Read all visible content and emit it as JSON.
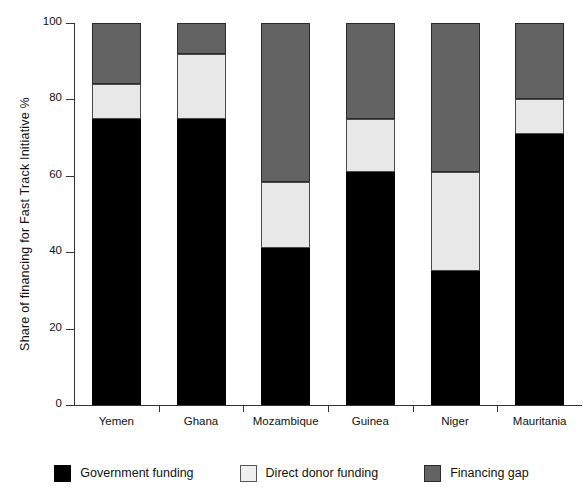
{
  "chart_data": {
    "type": "bar",
    "subtype": "stacked-bar-100-percent",
    "title": "",
    "xlabel": "",
    "ylabel": "Share of financing for Fast Track  Initiative %",
    "ylim": [
      0,
      100
    ],
    "yticks": [
      0,
      20,
      40,
      60,
      80,
      100
    ],
    "ytick_labels": [
      "0",
      "20",
      "40",
      "60",
      "80",
      "100"
    ],
    "grid": false,
    "legend_position": "bottom",
    "categories": [
      "Yemen",
      "Ghana",
      "Mozambique",
      "Guinea",
      "Niger",
      "Mauritania"
    ],
    "series": [
      {
        "name": "Government funding",
        "color": "#000000",
        "values": [
          75,
          75,
          41,
          61,
          35,
          71
        ]
      },
      {
        "name": "Direct donor funding",
        "color": "#e8e8e8",
        "values": [
          9,
          17,
          17.5,
          14,
          26,
          9
        ]
      },
      {
        "name": "Financing gap",
        "color": "#636363",
        "values": [
          16,
          8,
          41.5,
          25,
          39,
          20
        ]
      }
    ],
    "cumulative_tops": {
      "Yemen": [
        75,
        84,
        100
      ],
      "Ghana": [
        75,
        92,
        100
      ],
      "Mozambique": [
        41,
        58.5,
        100
      ],
      "Guinea": [
        61,
        75,
        100
      ],
      "Niger": [
        35,
        61,
        100
      ],
      "Mauritania": [
        71,
        80,
        100
      ]
    }
  },
  "legend": {
    "items": [
      {
        "label": "Government funding",
        "swatch": "gov"
      },
      {
        "label": "Direct donor funding",
        "swatch": "donor"
      },
      {
        "label": "Financing gap",
        "swatch": "gap"
      }
    ]
  }
}
